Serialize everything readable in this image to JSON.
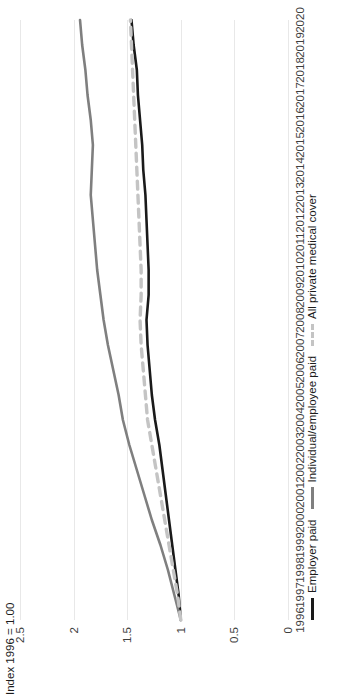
{
  "chart_data": {
    "type": "line",
    "title": "",
    "xlabel": "",
    "ylabel": "Index 1996 = 1.00",
    "xlim": [
      1996,
      2020
    ],
    "ylim": [
      0,
      2.5
    ],
    "yticks": [
      0,
      0.5,
      1,
      1.5,
      2,
      2.5
    ],
    "ytick_labels": [
      "0",
      "0.5",
      "1",
      "1.5",
      "2",
      "2.5"
    ],
    "grid": true,
    "legend_position": "bottom-left",
    "categories": [
      1996,
      1997,
      1998,
      1999,
      2000,
      2001,
      2002,
      2003,
      2004,
      2005,
      2006,
      2007,
      2008,
      2009,
      2010,
      2011,
      2012,
      2013,
      2014,
      2015,
      2016,
      2017,
      2018,
      2019,
      2020
    ],
    "series": [
      {
        "name": "Employer paid",
        "color": "#1a1a1a",
        "style": "solid",
        "values": [
          1.0,
          1.02,
          1.05,
          1.08,
          1.11,
          1.14,
          1.17,
          1.2,
          1.24,
          1.27,
          1.29,
          1.31,
          1.32,
          1.3,
          1.3,
          1.31,
          1.32,
          1.33,
          1.35,
          1.36,
          1.38,
          1.4,
          1.41,
          1.44,
          1.46
        ]
      },
      {
        "name": "Individual/employee paid",
        "color": "#7f7f7f",
        "style": "solid",
        "values": [
          1.0,
          1.06,
          1.12,
          1.19,
          1.27,
          1.34,
          1.41,
          1.48,
          1.54,
          1.58,
          1.63,
          1.68,
          1.72,
          1.75,
          1.78,
          1.8,
          1.82,
          1.84,
          1.83,
          1.82,
          1.84,
          1.87,
          1.89,
          1.92,
          1.94
        ]
      },
      {
        "name": "All private medical cover",
        "color": "#c4c4c4",
        "style": "dashed",
        "values": [
          1.0,
          1.03,
          1.07,
          1.11,
          1.15,
          1.19,
          1.23,
          1.27,
          1.31,
          1.33,
          1.35,
          1.37,
          1.38,
          1.37,
          1.37,
          1.38,
          1.39,
          1.4,
          1.41,
          1.42,
          1.43,
          1.44,
          1.45,
          1.46,
          1.47
        ]
      }
    ]
  },
  "legend": {
    "items": [
      {
        "label": "Employer paid"
      },
      {
        "label": "Individual/employee paid"
      },
      {
        "label": "All private medical cover"
      }
    ]
  }
}
